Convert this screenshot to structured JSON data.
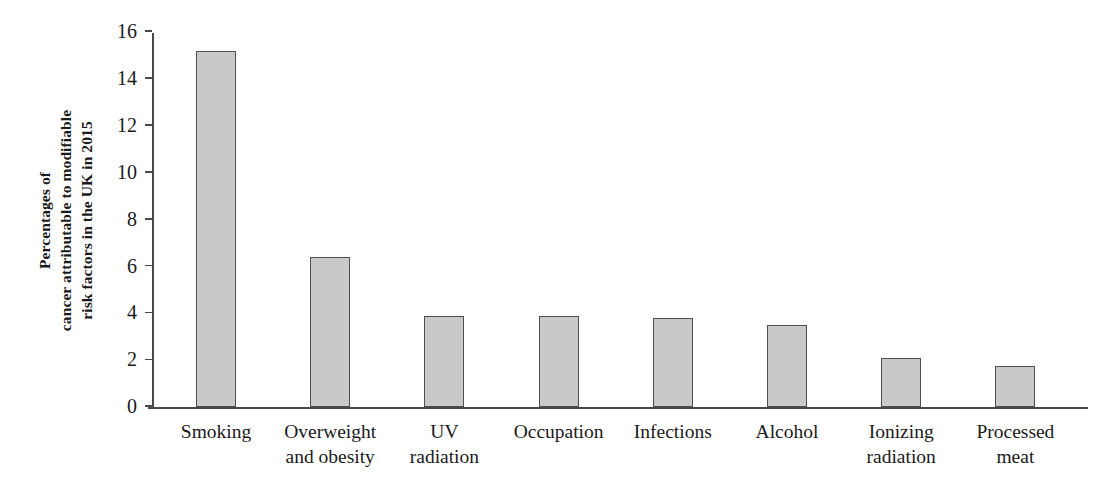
{
  "chart_data": {
    "type": "bar",
    "title": "",
    "xlabel": "",
    "ylabel": "Percentages of cancer attributable to modifiable risk factors in the UK in 2015",
    "ylabel_lines": [
      "Percentages of",
      "cancer attributable to modifiable",
      "risk factors in the UK in 2015"
    ],
    "categories": [
      "Smoking",
      "Overweight\nand obesity",
      "UV\nradiation",
      "Occupation",
      "Infections",
      "Alcohol",
      "Ionizing\nradiation",
      "Processed\nmeat"
    ],
    "values": [
      15.2,
      6.4,
      3.9,
      3.9,
      3.8,
      3.5,
      2.1,
      1.75
    ],
    "ylim": [
      0,
      16
    ],
    "ytick_values": [
      0,
      2,
      4,
      6,
      8,
      10,
      12,
      14,
      16
    ],
    "ytick_labels": [
      "0",
      "2",
      "4",
      "6",
      "8",
      "10",
      "12",
      "14",
      "16"
    ],
    "grid": false,
    "legend": null,
    "bar_fill_color": "#c9c9c9",
    "bar_edge_color": "#4f4f4f",
    "axis_color": "#4a4a4a",
    "background_color": "#ffffff"
  }
}
